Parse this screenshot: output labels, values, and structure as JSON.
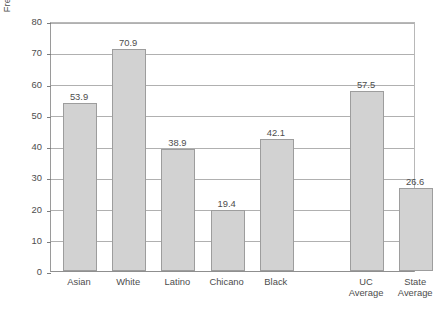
{
  "chart_data": {
    "type": "bar",
    "title": "",
    "xlabel": "",
    "ylabel": "Freshmen Whose Fathers Have a BA (%)",
    "categories": [
      "Asian",
      "White",
      "Latino",
      "Chicano",
      "Black",
      "UC Average",
      "State Average"
    ],
    "values": [
      53.9,
      70.9,
      38.9,
      19.4,
      42.1,
      57.5,
      26.6
    ],
    "value_labels": [
      "53.9",
      "70.9",
      "38.9",
      "19.4",
      "42.1",
      "57.5",
      "26.6"
    ],
    "ylim": [
      0,
      80
    ],
    "ytick_labels": [
      "0",
      "10",
      "20",
      "30",
      "40",
      "50",
      "60",
      "70",
      "80"
    ],
    "yticks": [
      0,
      10,
      20,
      30,
      40,
      50,
      60,
      70,
      80
    ],
    "grid": "horizontal",
    "legend": "none",
    "bar_color": "#d2d2d2",
    "bar_border_color": "#9d9d9d",
    "grid_color": "#b0b0b0",
    "axis_color": "#8f8f8f",
    "text_color": "#4d4d4d",
    "category_lines": [
      [
        "Asian"
      ],
      [
        "White"
      ],
      [
        "Latino"
      ],
      [
        "Chicano"
      ],
      [
        "Black"
      ],
      [
        "UC",
        "Average"
      ],
      [
        "State",
        "Average"
      ]
    ]
  },
  "caption": {
    "text": ""
  }
}
